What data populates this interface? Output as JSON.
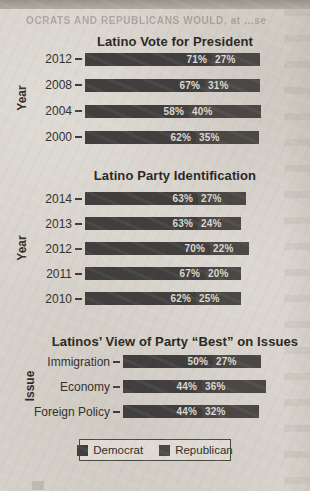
{
  "page": {
    "bleedthrough_text": "OCRATS AND REPUBLICANS WOULD, at ...se"
  },
  "colors": {
    "democrat": "#403f3d",
    "republican": "#4b4745",
    "bar_text": "#dcd8d1",
    "ink": "#29271f",
    "paper": "#d7d2cb"
  },
  "legend": {
    "items": [
      {
        "label": "Democrat",
        "color_key": "democrat"
      },
      {
        "label": "Republican",
        "color_key": "republican"
      }
    ]
  },
  "chart_data": [
    {
      "type": "bar",
      "stacked": true,
      "orientation": "horizontal",
      "title": "Latino Vote for President",
      "ylabel": "Year",
      "categories": [
        "2012",
        "2008",
        "2004",
        "2000"
      ],
      "series": [
        {
          "name": "Democrat",
          "values": [
            71,
            67,
            58,
            62
          ]
        },
        {
          "name": "Republican",
          "values": [
            27,
            31,
            40,
            35
          ]
        }
      ],
      "value_suffix": "%",
      "xlim": [
        0,
        100
      ],
      "grid": false,
      "legend_position": "shared-bottom"
    },
    {
      "type": "bar",
      "stacked": true,
      "orientation": "horizontal",
      "title": "Latino Party Identification",
      "ylabel": "Year",
      "categories": [
        "2014",
        "2013",
        "2012",
        "2011",
        "2010"
      ],
      "series": [
        {
          "name": "Democrat",
          "values": [
            63,
            63,
            70,
            67,
            62
          ]
        },
        {
          "name": "Republican",
          "values": [
            27,
            24,
            22,
            20,
            25
          ]
        }
      ],
      "value_suffix": "%",
      "xlim": [
        0,
        100
      ],
      "grid": false,
      "legend_position": "shared-bottom"
    },
    {
      "type": "bar",
      "stacked": true,
      "orientation": "horizontal",
      "title": "Latinos’ View of Party “Best” on Issues",
      "ylabel": "Issue",
      "categories": [
        "Immigration",
        "Economy",
        "Foreign Policy"
      ],
      "series": [
        {
          "name": "Democrat",
          "values": [
            50,
            44,
            44
          ]
        },
        {
          "name": "Republican",
          "values": [
            27,
            36,
            32
          ]
        }
      ],
      "value_suffix": "%",
      "xlim": [
        0,
        100
      ],
      "grid": false,
      "legend_position": "shared-bottom"
    }
  ]
}
